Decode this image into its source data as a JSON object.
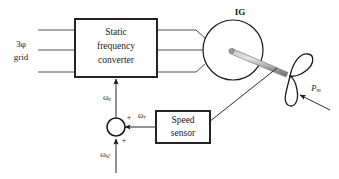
{
  "figure": {
    "type": "block-diagram"
  },
  "blocks": {
    "converter": {
      "line1": "Static",
      "line2": "frequency",
      "line3": "converter"
    },
    "speed_sensor": {
      "line1": "Speed",
      "line2": "sensor"
    },
    "machine": {
      "label": "IG"
    }
  },
  "labels": {
    "grid_line1": "3φ",
    "grid_line2": "grid",
    "omega_e": "ω",
    "omega_e_sub": "e",
    "omega_r": "ω",
    "omega_r_sub": "r",
    "omega_sl": "ω",
    "omega_sl_sub": "sl",
    "power_mech": "P",
    "power_mech_sub": "m",
    "sign_top": "+",
    "sign_bottom": "+"
  },
  "colors": {
    "background": "#ffffff",
    "stroke": "#1a1a1a",
    "wire": "#2b2b2b",
    "shaft_light": "#d8d8d8",
    "shaft_dark": "#8a8a8a"
  }
}
